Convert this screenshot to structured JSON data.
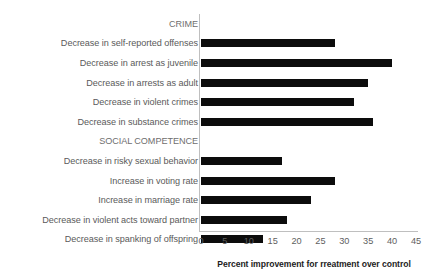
{
  "chart_data": {
    "type": "bar",
    "orientation": "horizontal",
    "title": "",
    "xlabel": "Percent improvement for rreatment over control",
    "ylabel": "",
    "xlim": [
      0,
      45
    ],
    "xticks": [
      0,
      5,
      10,
      15,
      20,
      25,
      30,
      35,
      40,
      45
    ],
    "grid": false,
    "legend": false,
    "bar_color": "#0c0c0c",
    "axis_color": "#bfbfbf",
    "label_color": "#5a5a5a",
    "rows": [
      {
        "label": "CRIME",
        "value": null,
        "is_group_header": true
      },
      {
        "label": "Decrease in self-reported offenses",
        "value": 28,
        "is_group_header": false
      },
      {
        "label": "Decrease in arrest as juvenile",
        "value": 40,
        "is_group_header": false
      },
      {
        "label": "Decrease in arrests as adult",
        "value": 35,
        "is_group_header": false
      },
      {
        "label": "Decrease in violent crimes",
        "value": 32,
        "is_group_header": false
      },
      {
        "label": "Decrease in substance crimes",
        "value": 36,
        "is_group_header": false
      },
      {
        "label": "SOCIAL COMPETENCE",
        "value": null,
        "is_group_header": true
      },
      {
        "label": "Decrease in risky sexual behavior",
        "value": 17,
        "is_group_header": false
      },
      {
        "label": "Increase in voting rate",
        "value": 28,
        "is_group_header": false
      },
      {
        "label": "Increase in marriage rate",
        "value": 23,
        "is_group_header": false
      },
      {
        "label": "Decrease in violent acts toward partner",
        "value": 18,
        "is_group_header": false
      },
      {
        "label": "Decrease in spanking of offspring",
        "value": 13,
        "is_group_header": false
      }
    ],
    "categories": [
      "CRIME",
      "Decrease in self-reported offenses",
      "Decrease in arrest as juvenile",
      "Decrease in arrests as adult",
      "Decrease in violent crimes",
      "Decrease in substance crimes",
      "SOCIAL COMPETENCE",
      "Decrease in risky sexual behavior",
      "Increase in voting rate",
      "Increase in marriage rate",
      "Decrease in violent acts toward partner",
      "Decrease in spanking of offspring"
    ],
    "values": [
      null,
      28,
      40,
      35,
      32,
      36,
      null,
      17,
      28,
      23,
      18,
      13
    ]
  }
}
